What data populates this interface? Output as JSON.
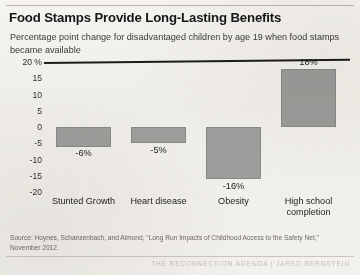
{
  "header": {
    "title": "Food Stamps Provide Long-Lasting Benefits",
    "subtitle": "Percentage point change for disadvantaged children by age 19 when food stamps became available"
  },
  "footer": {
    "source": "Source: Hoynes, Schanzenbach, and Almond, \"Long Run Impacts of Childhood Access to the Safety Net,\" November 2012.",
    "watermark": "THE RECONNECTION AGENDA | JARED BERNSTEIN"
  },
  "axis": {
    "y_ticks": [
      "20 %",
      "15",
      "10",
      "5",
      "0",
      "-5",
      "-10",
      "-15",
      "-20"
    ]
  },
  "colors": {
    "bar": "#9b9b99",
    "zero_line": "#1b1b1b",
    "background": "#f3f1ec",
    "text": "#23231f"
  },
  "chart_data": {
    "type": "bar",
    "title": "Food Stamps Provide Long-Lasting Benefits",
    "subtitle": "Percentage point change for disadvantaged children by age 19 when food stamps became available",
    "xlabel": "",
    "ylabel": "",
    "ylim": [
      -20,
      20
    ],
    "grid": false,
    "legend": "none",
    "categories": [
      "Stunted Growth",
      "Heart disease",
      "Obesity",
      "High school completion"
    ],
    "values": [
      -6,
      -5,
      -16,
      18
    ],
    "data_labels": [
      "-6%",
      "-5%",
      "-16%",
      "18%"
    ],
    "ytick_values": [
      20,
      15,
      10,
      5,
      0,
      -5,
      -10,
      -15,
      -20
    ],
    "ytick_labels": [
      "20 %",
      "15",
      "10",
      "5",
      "0",
      "-5",
      "-10",
      "-15",
      "-20"
    ],
    "units": "percentage points"
  }
}
